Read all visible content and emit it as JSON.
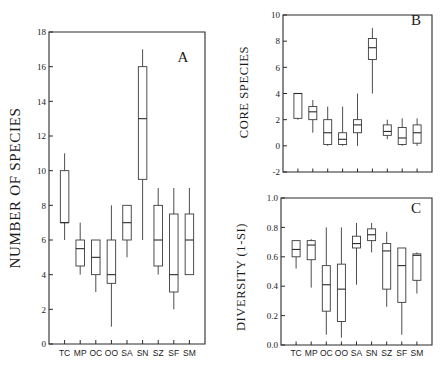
{
  "figure": {
    "background": "#ffffff",
    "ink_color": "#1a1a1a",
    "panel_letters": {
      "a": "A",
      "b": "B",
      "c": "C"
    }
  },
  "chart_data": [
    {
      "panel": "A",
      "type": "box",
      "title": "",
      "xlabel": "",
      "ylabel": "NUMBER OF SPECIES",
      "ylim": [
        0,
        18
      ],
      "yticks": [
        0,
        2,
        4,
        6,
        8,
        10,
        12,
        14,
        16,
        18
      ],
      "ytick_labels": [
        "0",
        "2",
        "4",
        "6",
        "8",
        "10",
        "12",
        "14",
        "16",
        "18"
      ],
      "grid": false,
      "legend": "none",
      "categories": [
        "TC",
        "MP",
        "OC",
        "OO",
        "SA",
        "SN",
        "SZ",
        "SF",
        "SM"
      ],
      "boxes": [
        {
          "category": "TC",
          "whisker_low": 6.0,
          "q1": 7.0,
          "median": 7.0,
          "q3": 10.0,
          "whisker_high": 11.0
        },
        {
          "category": "MP",
          "whisker_low": 4.0,
          "q1": 4.5,
          "median": 5.5,
          "q3": 6.0,
          "whisker_high": 7.0
        },
        {
          "category": "OC",
          "whisker_low": 3.0,
          "q1": 4.0,
          "median": 5.0,
          "q3": 6.0,
          "whisker_high": 6.0
        },
        {
          "category": "OO",
          "whisker_low": 1.0,
          "q1": 3.5,
          "median": 4.0,
          "q3": 6.0,
          "whisker_high": 8.0
        },
        {
          "category": "SA",
          "whisker_low": 5.0,
          "q1": 6.0,
          "median": 7.0,
          "q3": 8.0,
          "whisker_high": 8.0
        },
        {
          "category": "SN",
          "whisker_low": 6.0,
          "q1": 9.5,
          "median": 13.0,
          "q3": 16.0,
          "whisker_high": 17.0
        },
        {
          "category": "SZ",
          "whisker_low": 4.0,
          "q1": 4.5,
          "median": 6.0,
          "q3": 8.0,
          "whisker_high": 9.0
        },
        {
          "category": "SF",
          "whisker_low": 2.0,
          "q1": 3.0,
          "median": 4.0,
          "q3": 7.5,
          "whisker_high": 9.0
        },
        {
          "category": "SM",
          "whisker_low": 4.0,
          "q1": 4.0,
          "median": 6.0,
          "q3": 7.5,
          "whisker_high": 9.0
        }
      ]
    },
    {
      "panel": "B",
      "type": "box",
      "title": "",
      "xlabel": "",
      "ylabel": "CORE SPECIES",
      "ylim": [
        -2,
        10
      ],
      "yticks": [
        -2,
        0,
        2,
        4,
        6,
        8,
        10
      ],
      "ytick_labels": [
        "-2",
        "0",
        "2",
        "4",
        "6",
        "8",
        "10"
      ],
      "grid": false,
      "legend": "none",
      "categories": [
        "TC",
        "MP",
        "OC",
        "OO",
        "SA",
        "SN",
        "SZ",
        "SF",
        "SM"
      ],
      "boxes": [
        {
          "category": "TC",
          "whisker_low": 2.0,
          "q1": 2.1,
          "median": 4.0,
          "q3": 4.0,
          "whisker_high": 4.0
        },
        {
          "category": "MP",
          "whisker_low": 1.0,
          "q1": 2.0,
          "median": 2.6,
          "q3": 3.0,
          "whisker_high": 3.5
        },
        {
          "category": "OC",
          "whisker_low": 0.0,
          "q1": 0.1,
          "median": 1.0,
          "q3": 2.0,
          "whisker_high": 3.0
        },
        {
          "category": "OO",
          "whisker_low": 0.0,
          "q1": 0.1,
          "median": 0.5,
          "q3": 1.0,
          "whisker_high": 3.0
        },
        {
          "category": "SA",
          "whisker_low": 0.0,
          "q1": 1.0,
          "median": 1.6,
          "q3": 2.0,
          "whisker_high": 4.0
        },
        {
          "category": "SN",
          "whisker_low": 4.0,
          "q1": 6.6,
          "median": 7.5,
          "q3": 8.2,
          "whisker_high": 9.0
        },
        {
          "category": "SZ",
          "whisker_low": 0.5,
          "q1": 0.8,
          "median": 1.1,
          "q3": 1.6,
          "whisker_high": 2.0
        },
        {
          "category": "SF",
          "whisker_low": 0.0,
          "q1": 0.1,
          "median": 0.6,
          "q3": 1.4,
          "whisker_high": 2.1
        },
        {
          "category": "SM",
          "whisker_low": 0.0,
          "q1": 0.2,
          "median": 1.0,
          "q3": 1.6,
          "whisker_high": 2.1
        }
      ]
    },
    {
      "panel": "C",
      "type": "box",
      "title": "",
      "xlabel": "",
      "ylabel": "DIVERSITY (1-SI)",
      "ylim": [
        0.0,
        1.0
      ],
      "yticks": [
        0.0,
        0.2,
        0.4,
        0.6,
        0.8,
        1.0
      ],
      "ytick_labels": [
        "0.0",
        "0.2",
        "0.4",
        "0.6",
        "0.8",
        "1.0"
      ],
      "grid": false,
      "legend": "none",
      "categories": [
        "TC",
        "MP",
        "OC",
        "OO",
        "SA",
        "SN",
        "SZ",
        "SF",
        "SM"
      ],
      "boxes": [
        {
          "category": "TC",
          "whisker_low": 0.52,
          "q1": 0.6,
          "median": 0.65,
          "q3": 0.71,
          "whisker_high": 0.71
        },
        {
          "category": "MP",
          "whisker_low": 0.39,
          "q1": 0.58,
          "median": 0.68,
          "q3": 0.71,
          "whisker_high": 0.72
        },
        {
          "category": "OC",
          "whisker_low": 0.07,
          "q1": 0.23,
          "median": 0.41,
          "q3": 0.54,
          "whisker_high": 0.8
        },
        {
          "category": "OO",
          "whisker_low": 0.05,
          "q1": 0.16,
          "median": 0.38,
          "q3": 0.55,
          "whisker_high": 0.8
        },
        {
          "category": "SA",
          "whisker_low": 0.41,
          "q1": 0.66,
          "median": 0.69,
          "q3": 0.74,
          "whisker_high": 0.83
        },
        {
          "category": "SN",
          "whisker_low": 0.63,
          "q1": 0.71,
          "median": 0.75,
          "q3": 0.79,
          "whisker_high": 0.83
        },
        {
          "category": "SZ",
          "whisker_low": 0.26,
          "q1": 0.38,
          "median": 0.64,
          "q3": 0.69,
          "whisker_high": 0.77
        },
        {
          "category": "SF",
          "whisker_low": 0.07,
          "q1": 0.29,
          "median": 0.54,
          "q3": 0.66,
          "whisker_high": 0.66
        },
        {
          "category": "SM",
          "whisker_low": 0.35,
          "q1": 0.44,
          "median": 0.61,
          "q3": 0.62,
          "whisker_high": 0.63
        }
      ]
    }
  ]
}
